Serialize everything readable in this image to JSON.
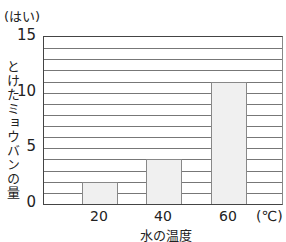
{
  "chart_data": {
    "type": "bar",
    "title": "",
    "categories": [
      "20",
      "40",
      "60"
    ],
    "values": [
      2,
      4,
      11
    ],
    "xlabel": "水の温度",
    "x_unit": "(℃)",
    "ylabel": "とけたミョウバンの量",
    "y_unit": "(はい)",
    "ylim": [
      0,
      15
    ],
    "yticks": [
      "0",
      "5",
      "10",
      "15"
    ],
    "grid": true,
    "grid_step": 1,
    "legend": null
  }
}
